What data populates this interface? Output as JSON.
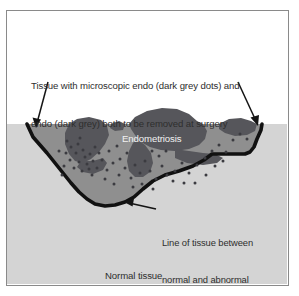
{
  "figure": {
    "kind": "medical-illustration",
    "title_visible": false,
    "frame": {
      "border_color": "#8a8a8a",
      "background": "#ffffff"
    },
    "colors": {
      "page_background": "#ffffff",
      "normal_tissue": "#d4d4d4",
      "abnormal_tissue": "#8f8f8f",
      "endometriosis_dark": "#56565b",
      "microscopic_dot": "#3b3b40",
      "vaporization_line": "#111111",
      "arrow": "#141414",
      "caption_text": "#2e2e2e",
      "endo_label_text": "#f2f2f2"
    },
    "captions": {
      "top": {
        "line1": "Tissue with microscopic endo (dark grey dots) and",
        "line2": "endo (dark grey) both to be removed at surgery"
      },
      "endometriosis_label": "Endometriosis",
      "boundary": {
        "line1": "Line of tissue between",
        "line2": "normal and abnormal",
        "line3": "to be vaporized"
      },
      "normal_tissue_label": "Normal tissue"
    },
    "arrows": [
      {
        "name": "left-arrow",
        "from_x": 47,
        "from_y": 81,
        "to_x": 35,
        "to_y": 125
      },
      {
        "name": "right-arrow",
        "from_x": 237,
        "from_y": 81,
        "to_x": 257,
        "to_y": 123
      },
      {
        "name": "boundary-arrow",
        "from_x": 153,
        "from_y": 208,
        "to_x": 123,
        "to_y": 201
      }
    ],
    "regions": [
      {
        "name": "normal-tissue-region",
        "label": "Normal tissue",
        "fill": "#d4d4d4"
      },
      {
        "name": "abnormal-tissue-region",
        "label": "Tissue to be removed",
        "fill": "#8f8f8f"
      },
      {
        "name": "endometriosis-region",
        "label": "Endometriosis",
        "fill": "#56565b"
      }
    ],
    "microscopic_dots": [
      [
        64,
        144
      ],
      [
        71,
        141
      ],
      [
        76,
        147
      ],
      [
        69,
        150
      ],
      [
        78,
        154
      ],
      [
        63,
        157
      ],
      [
        72,
        159
      ],
      [
        80,
        161
      ],
      [
        67,
        165
      ],
      [
        75,
        168
      ],
      [
        83,
        151
      ],
      [
        86,
        158
      ],
      [
        88,
        144
      ],
      [
        59,
        150
      ],
      [
        82,
        166
      ],
      [
        90,
        165
      ],
      [
        60,
        138
      ],
      [
        73,
        135
      ],
      [
        57,
        163
      ],
      [
        85,
        172
      ],
      [
        95,
        157
      ],
      [
        100,
        167
      ],
      [
        106,
        160
      ],
      [
        112,
        172
      ],
      [
        118,
        165
      ],
      [
        124,
        175
      ],
      [
        113,
        156
      ],
      [
        120,
        150
      ],
      [
        128,
        162
      ],
      [
        133,
        170
      ],
      [
        138,
        158
      ],
      [
        143,
        168
      ],
      [
        149,
        176
      ],
      [
        155,
        163
      ],
      [
        160,
        172
      ],
      [
        126,
        184
      ],
      [
        135,
        181
      ],
      [
        146,
        186
      ],
      [
        107,
        181
      ],
      [
        98,
        176
      ],
      [
        168,
        168
      ],
      [
        175,
        160
      ],
      [
        182,
        170
      ],
      [
        190,
        162
      ],
      [
        198,
        155
      ],
      [
        205,
        148
      ],
      [
        212,
        142
      ],
      [
        219,
        149
      ],
      [
        226,
        137
      ],
      [
        233,
        131
      ],
      [
        240,
        136
      ],
      [
        166,
        178
      ],
      [
        177,
        180
      ],
      [
        188,
        180
      ],
      [
        199,
        172
      ],
      [
        208,
        163
      ],
      [
        216,
        158
      ],
      [
        52,
        148
      ],
      [
        55,
        172
      ],
      [
        92,
        150
      ],
      [
        102,
        148
      ],
      [
        110,
        143
      ],
      [
        145,
        148
      ],
      [
        152,
        153
      ],
      [
        159,
        148
      ]
    ]
  }
}
